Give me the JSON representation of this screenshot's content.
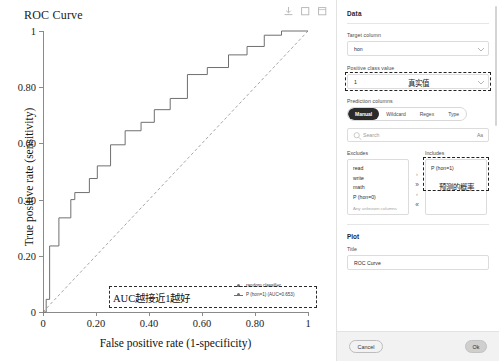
{
  "chart": {
    "title": "ROC Curve",
    "toolbar": [
      {
        "name": "download-icon",
        "label": "download"
      },
      {
        "name": "copy-icon",
        "label": "copy"
      },
      {
        "name": "expand-icon",
        "label": "expand"
      }
    ],
    "annotation": "AUC越接近1越好"
  },
  "chart_data": {
    "type": "line",
    "title": "ROC Curve",
    "xlabel": "False positive rate (1-specificity)",
    "ylabel": "True positive rate (sensitivity)",
    "xlim": [
      0,
      1
    ],
    "ylim": [
      0,
      1
    ],
    "xticks": [
      "0",
      "0.20",
      "0.40",
      "0.60",
      "0.80",
      "1"
    ],
    "xtick_values": [
      0,
      0.2,
      0.4,
      0.6,
      0.8,
      1
    ],
    "yticks": [
      "0",
      "0.20",
      "0.40",
      "0.60",
      "0.80",
      "1"
    ],
    "ytick_values": [
      0,
      0.2,
      0.4,
      0.6,
      0.8,
      1
    ],
    "grid": false,
    "legend_position": "lower right",
    "series": [
      {
        "name": "random classifier",
        "style": "dashed",
        "color": "#8f8f8f",
        "x": [
          0,
          1
        ],
        "y": [
          0,
          1
        ]
      },
      {
        "name": "P (hon=1) (AUC=0.653)",
        "style": "step",
        "color": "#6f6f6f",
        "x": [
          0.0,
          0.012,
          0.012,
          0.025,
          0.025,
          0.06,
          0.06,
          0.105,
          0.105,
          0.12,
          0.12,
          0.175,
          0.175,
          0.205,
          0.205,
          0.255,
          0.255,
          0.31,
          0.31,
          0.37,
          0.37,
          0.42,
          0.42,
          0.48,
          0.48,
          0.545,
          0.545,
          0.62,
          0.62,
          0.7,
          0.7,
          0.77,
          0.77,
          0.835,
          0.835,
          0.9,
          0.9,
          1.0
        ],
        "y": [
          0.0,
          0.0,
          0.045,
          0.045,
          0.235,
          0.235,
          0.335,
          0.335,
          0.4,
          0.4,
          0.425,
          0.425,
          0.475,
          0.475,
          0.52,
          0.52,
          0.595,
          0.595,
          0.645,
          0.645,
          0.675,
          0.675,
          0.72,
          0.72,
          0.76,
          0.76,
          0.845,
          0.845,
          0.87,
          0.87,
          0.915,
          0.915,
          0.945,
          0.945,
          0.985,
          0.985,
          1.0,
          1.0
        ]
      }
    ],
    "legend": [
      "random classifier",
      "P (hon=1) (AUC=0.653)"
    ],
    "annotations": [
      "AUC越接近1越好"
    ]
  },
  "panel": {
    "data_section": {
      "title": "Data",
      "target_column_label": "Target column",
      "target_column_value": "hon",
      "positive_class_label": "Positive class value",
      "positive_class_value": "1",
      "positive_class_annotation": "真实值",
      "prediction_columns_label": "Prediction columns",
      "mode_tabs": [
        "Manual",
        "Wildcard",
        "Regex",
        "Type"
      ],
      "mode_active": "Manual",
      "search_placeholder": "Search",
      "search_value": "",
      "case_toggle": "Aa",
      "excludes_label": "Excludes",
      "excludes_items": [
        "read",
        "write",
        "math",
        "P (hon=0)"
      ],
      "excludes_footer": "Any unknown columns",
      "includes_label": "Includes",
      "includes_items": [
        "P (hon=1)"
      ],
      "includes_annotation": "预测的概率",
      "move_buttons": [
        "›",
        "»",
        "‹",
        "«"
      ]
    },
    "plot_section": {
      "title": "Plot",
      "title_label": "Title",
      "title_value": "ROC Curve"
    },
    "footer": {
      "cancel_label": "Cancel",
      "ok_label": "Ok"
    }
  }
}
